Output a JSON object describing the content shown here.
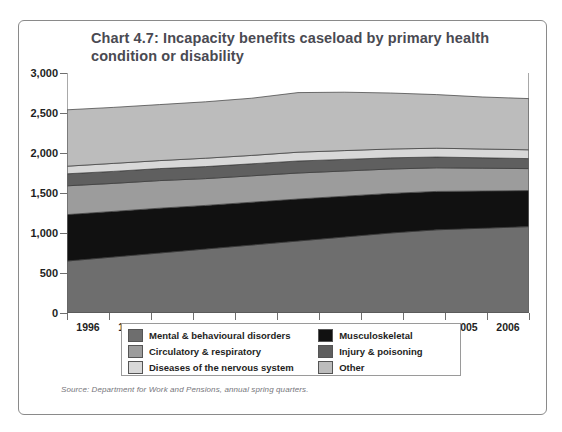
{
  "figure": {
    "title": "Chart 4.7: Incapacity benefits caseload by primary health condition or disability",
    "source": "Source: Department for Work and Pensions, annual spring quarters."
  },
  "chart_data": {
    "type": "area",
    "title": "Chart 4.7: Incapacity benefits caseload by primary health condition or disability",
    "xlabel": "",
    "ylabel": "Caseload (thousands)",
    "stacked": true,
    "grid": false,
    "legend_position": "bottom",
    "x": [
      1996,
      1997,
      1998,
      1999,
      2000,
      2001,
      2002,
      2003,
      2004,
      2005,
      2006
    ],
    "categories": [
      "1996",
      "1997",
      "1998",
      "1999",
      "2000",
      "2001",
      "2002",
      "2003",
      "2004",
      "2005",
      "2006"
    ],
    "xlim": [
      1995.5,
      2006.5
    ],
    "ylim": [
      0,
      3000
    ],
    "yticks": [
      0,
      500,
      1000,
      1500,
      2000,
      2500,
      3000
    ],
    "ytick_labels": [
      "0",
      "500",
      "1,000",
      "1,500",
      "2,000",
      "2,500",
      "3,000"
    ],
    "series": [
      {
        "name": "Mental & behavioural disorders",
        "color": "#6e6e6e",
        "values": [
          650,
          700,
          750,
          800,
          850,
          900,
          950,
          1000,
          1040,
          1060,
          1080
        ]
      },
      {
        "name": "Musculoskeletal",
        "color": "#111111",
        "values": [
          580,
          570,
          560,
          545,
          535,
          525,
          510,
          495,
          480,
          465,
          450
        ]
      },
      {
        "name": "Circulatory & respiratory",
        "color": "#9c9c9c",
        "values": [
          360,
          350,
          345,
          335,
          330,
          325,
          315,
          305,
          295,
          285,
          275
        ]
      },
      {
        "name": "Injury & poisoning",
        "color": "#5f5f5f",
        "values": [
          150,
          150,
          150,
          150,
          150,
          150,
          145,
          140,
          135,
          130,
          125
        ]
      },
      {
        "name": "Diseases of the nervous system",
        "color": "#d8d8d8",
        "values": [
          95,
          100,
          100,
          105,
          105,
          110,
          110,
          110,
          110,
          110,
          110
        ]
      },
      {
        "name": "Other",
        "color": "#bcbcbc",
        "values": [
          705,
          700,
          700,
          705,
          715,
          745,
          730,
          700,
          670,
          650,
          640
        ]
      }
    ],
    "totals": [
      2540,
      2570,
      2605,
      2640,
      2685,
      2755,
      2760,
      2750,
      2730,
      2700,
      2680
    ]
  },
  "legend": {
    "entries": [
      {
        "label": "Mental & behavioural disorders",
        "color": "#6e6e6e"
      },
      {
        "label": "Musculoskeletal",
        "color": "#111111"
      },
      {
        "label": "Circulatory & respiratory",
        "color": "#9c9c9c"
      },
      {
        "label": "Injury & poisoning",
        "color": "#5f5f5f"
      },
      {
        "label": "Diseases of the nervous system",
        "color": "#d8d8d8"
      },
      {
        "label": "Other",
        "color": "#bcbcbc"
      }
    ]
  }
}
